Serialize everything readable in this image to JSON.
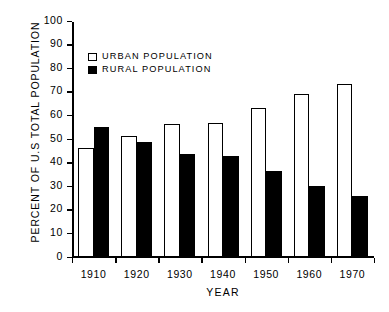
{
  "chart_data": {
    "type": "bar",
    "title": "",
    "xlabel": "YEAR",
    "ylabel": "PERCENT OF U.S TOTAL POPULATION",
    "categories": [
      "1910",
      "1920",
      "1930",
      "1940",
      "1950",
      "1960",
      "1970"
    ],
    "series": [
      {
        "name": "URBAN POPULATION",
        "color": "#ffffff",
        "edge_color": "#000000",
        "values": [
          46,
          51,
          56,
          56.5,
          63,
          69,
          73
        ]
      },
      {
        "name": "RURAL POPULATION",
        "color": "#000000",
        "edge_color": "#000000",
        "values": [
          55,
          48.5,
          43.5,
          42.5,
          36,
          30,
          25.5
        ]
      }
    ],
    "ylim": [
      0,
      100
    ],
    "yticks": [
      0,
      10,
      20,
      30,
      40,
      50,
      60,
      70,
      80,
      90,
      100
    ],
    "ytick_labels": [
      "0",
      "10",
      "20",
      "30",
      "40",
      "50",
      "60",
      "70",
      "80",
      "90",
      "100"
    ],
    "grid": false,
    "legend_position": "upper-left-inside"
  },
  "legend": {
    "items": [
      {
        "label": "URBAN POPULATION",
        "swatch": "hollow"
      },
      {
        "label": "RURAL POPULATION",
        "swatch": "filled"
      }
    ]
  }
}
